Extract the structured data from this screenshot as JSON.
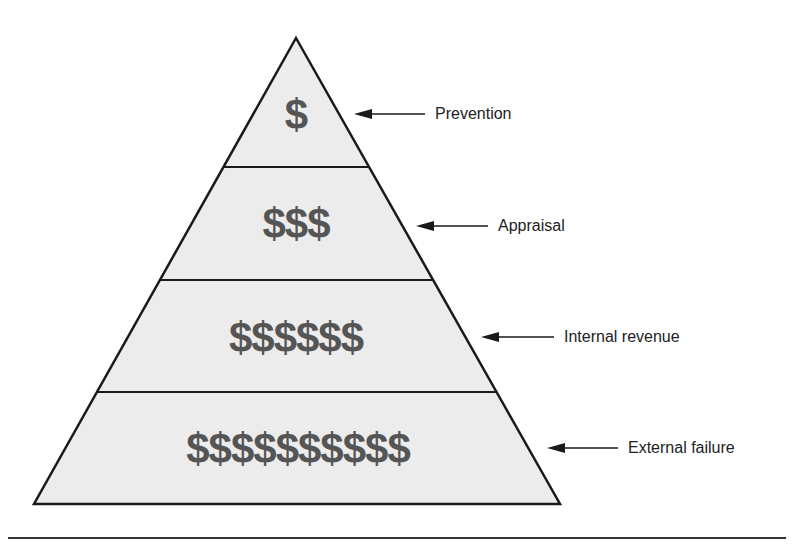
{
  "diagram": {
    "type": "cost-of-quality-pyramid",
    "fill_color": "#ececec",
    "stroke_color": "#1a1a1a",
    "symbol_color": "#555555",
    "levels": [
      {
        "label": "Prevention",
        "symbols": "$",
        "count": 1
      },
      {
        "label": "Appraisal",
        "symbols": "$$$",
        "count": 3
      },
      {
        "label": "Internal revenue",
        "symbols": "$$$$$$",
        "count": 6
      },
      {
        "label": "External failure",
        "symbols": "$$$$$$$$$$",
        "count": 10
      }
    ]
  }
}
